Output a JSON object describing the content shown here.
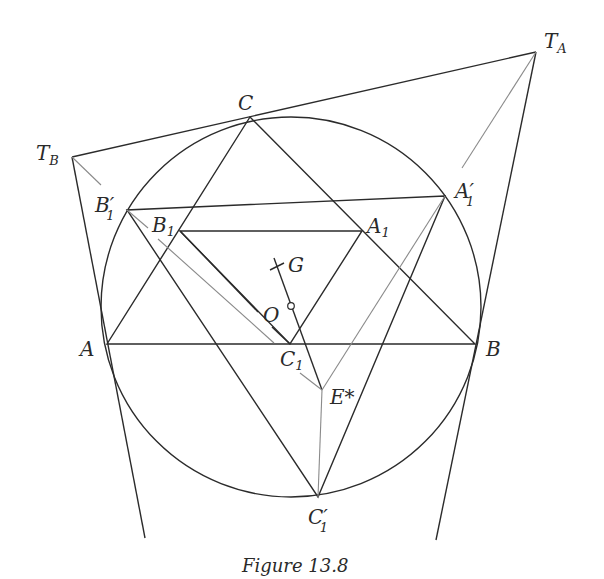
{
  "figure": {
    "caption": "Figure 13.8",
    "circle": {
      "cx": 291,
      "cy": 307,
      "r": 190
    },
    "points": {
      "A": {
        "x": 107,
        "y": 344,
        "label": "A"
      },
      "B": {
        "x": 475,
        "y": 344,
        "label": "B"
      },
      "C": {
        "x": 250,
        "y": 117,
        "label": "C"
      },
      "TA": {
        "x": 536,
        "y": 52,
        "label": "T",
        "sub": "A"
      },
      "TB": {
        "x": 72,
        "y": 157,
        "label": "T",
        "sub": "B"
      },
      "A1": {
        "x": 362,
        "y": 231,
        "label": "A",
        "sub": "1"
      },
      "B1": {
        "x": 180,
        "y": 231,
        "label": "B",
        "sub": "1"
      },
      "C1": {
        "x": 290,
        "y": 344,
        "label": "C",
        "sub": "1"
      },
      "A1p": {
        "x": 445,
        "y": 196,
        "label": "A′",
        "sub": "1"
      },
      "B1p": {
        "x": 127,
        "y": 210,
        "label": "B′",
        "sub": "1"
      },
      "C1p": {
        "x": 318,
        "y": 497,
        "label": "C′",
        "sub": "1"
      },
      "Estar": {
        "x": 322,
        "y": 390,
        "label": "E*"
      },
      "G": {
        "x": 277,
        "y": 266,
        "label": "G"
      },
      "O": {
        "x": 291,
        "y": 306,
        "label": "O"
      }
    }
  },
  "colors": {
    "line": "#2b2b2b",
    "construction": "#8a8a8a",
    "background": "#ffffff"
  }
}
